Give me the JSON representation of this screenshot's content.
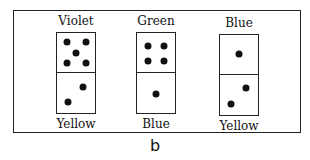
{
  "dominoes": [
    {
      "top_label": "Violet",
      "bottom_label": "Yellow",
      "top_pips": 5,
      "bottom_pips": 2
    },
    {
      "top_label": "Green",
      "bottom_label": "Blue",
      "top_pips": 4,
      "bottom_pips": 1
    },
    {
      "top_label": "Blue",
      "bottom_label": "Yellow",
      "top_pips": 1,
      "bottom_pips": 2
    }
  ],
  "caption": "b"
}
